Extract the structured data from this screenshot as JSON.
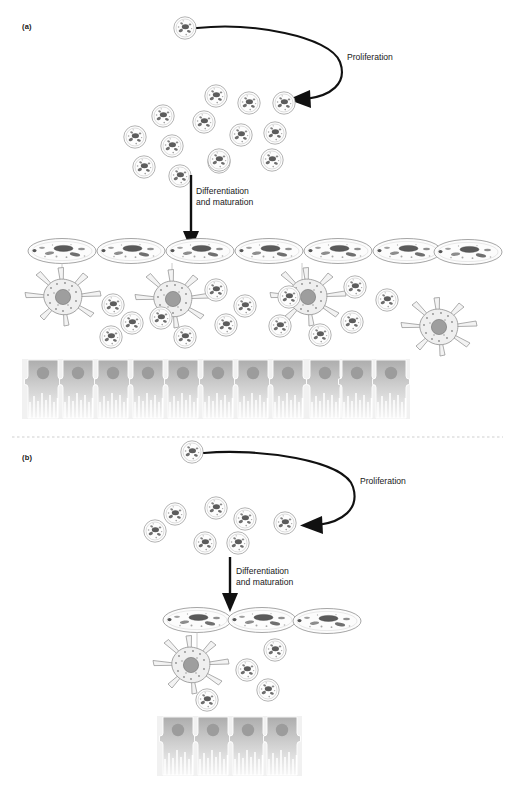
{
  "figure": {
    "title_visible": false,
    "background": "#ffffff",
    "width": 513,
    "height": 795
  },
  "panels": [
    {
      "id": "a",
      "label": "(a)",
      "label_pos": {
        "x": 22,
        "y": 28
      },
      "proliferation_label": "Proliferation",
      "proliferation_label_pos": {
        "x": 347,
        "y": 58
      },
      "differentiation_label": "Differentiation\nand maturation",
      "differentiation_label_pos": {
        "x": 196,
        "y": 193
      },
      "counts": {
        "source_cells": 1,
        "proliferating_round_cells": 14,
        "oval_cells": 7,
        "astrocytes": 4,
        "scattered_round_cells": 14,
        "ependymal_cells": 11
      }
    },
    {
      "id": "b",
      "label": "(b)",
      "label_pos": {
        "x": 22,
        "y": 459
      },
      "proliferation_label": "Proliferation",
      "proliferation_label_pos": {
        "x": 360,
        "y": 482
      },
      "differentiation_label": "Differentiation\nand maturation",
      "differentiation_label_pos": {
        "x": 236,
        "y": 573
      },
      "counts": {
        "source_cells": 1,
        "proliferating_round_cells": 7,
        "oval_cells": 3,
        "astrocytes": 1,
        "scattered_round_cells": 4,
        "ependymal_cells": 4
      }
    }
  ],
  "divider": {
    "style": "dashed",
    "color": "#cfcfcf",
    "y": 437,
    "x1": 12,
    "x2": 503
  },
  "colors": {
    "arrow": "#111111",
    "cell_outline": "#8e8e8e",
    "cell_fill": "#fbfbfb",
    "nucleus_dark": "#4a4a4a",
    "astrocyte_nucleus": "#9a9a9a",
    "ependymal_fill_top": "#b9b9b9",
    "ependymal_fill_bottom": "#f2f2f2",
    "ependymal_band": "#f1f1f1",
    "text": "#191919",
    "divider": "#cfcfcf"
  },
  "icon_names": [
    "progenitor-cell-icon",
    "oligodendrocyte-oval-cell-icon",
    "astrocyte-star-cell-icon",
    "ependymal-cell-icon",
    "curved-proliferation-arrow-icon",
    "straight-differentiation-arrow-icon"
  ]
}
